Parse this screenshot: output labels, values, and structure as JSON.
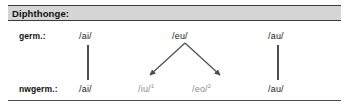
{
  "figure": {
    "header": {
      "title": "Diphthonge:"
    },
    "rows": [
      {
        "label": "germ.:"
      },
      {
        "label": "nwgerm.:"
      }
    ],
    "colors": {
      "header_band": "#d5d5d5",
      "header_rule": "#3a3a3a",
      "text": "#1a1a1a",
      "muted_text": "#8c8c8c",
      "connector": "#4d4d4d",
      "arrow": "#4d4d4d",
      "bottom_rule": "#4a4a4a"
    },
    "germanic": {
      "ai": "/ai/",
      "eu": "/eu/",
      "au": "/au/"
    },
    "northwest_germanic": {
      "ai": "/ai/",
      "iu": "/iu/",
      "iu_footnote": "1",
      "eo": "/eo/",
      "eo_footnote": "2",
      "au": "/au/"
    },
    "connectors": [
      {
        "name": "ai-to-ai",
        "type": "vertical-bar"
      },
      {
        "name": "au-to-au",
        "type": "vertical-bar"
      },
      {
        "name": "eu-to-iu",
        "type": "arrow"
      },
      {
        "name": "eu-to-eo",
        "type": "arrow"
      }
    ]
  }
}
